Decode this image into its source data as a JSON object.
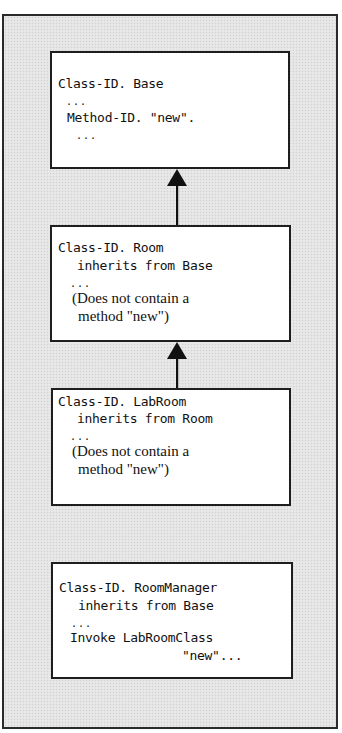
{
  "diagram": {
    "type": "class inheritance diagram",
    "boxes": [
      {
        "id": "base",
        "lines": [
          "Class-ID. Base",
          "...",
          "Method-ID. \"new\".",
          "..."
        ]
      },
      {
        "id": "room",
        "lines": [
          "Class-ID. Room",
          "inherits from Base",
          "...",
          "(Does not contain a",
          "method \"new\")"
        ]
      },
      {
        "id": "labroom",
        "lines": [
          "Class-ID. LabRoom",
          "inherits from Room",
          "...",
          "(Does not contain a",
          "method \"new\")"
        ]
      },
      {
        "id": "roommanager",
        "lines": [
          "Class-ID. RoomManager",
          "inherits from Base",
          "...",
          "Invoke LabRoomClass",
          "\"new\"..."
        ]
      }
    ],
    "arrows": [
      {
        "from": "room",
        "to": "base",
        "style": "solid triangle head"
      },
      {
        "from": "labroom",
        "to": "room",
        "style": "solid triangle head"
      }
    ],
    "colors": {
      "frame_background": "#e4e4e4",
      "box_background": "#ffffff",
      "stroke": "#1e1e1e"
    }
  }
}
